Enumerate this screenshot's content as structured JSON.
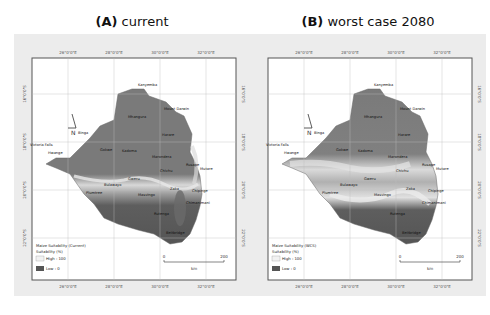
{
  "figure": {
    "panels": [
      {
        "id": "A",
        "letter": "(A)",
        "title": "current",
        "legend": {
          "title": "Maize Suitability (Current)",
          "unit": "Suitability (%)",
          "high": "High : 100",
          "low": "Low : 0"
        }
      },
      {
        "id": "B",
        "letter": "(B)",
        "title": "worst case 2080",
        "legend": {
          "title": "Maize Suitability (WCS)",
          "unit": "Suitability (%)",
          "high": "High : 100",
          "low": "Low : 0"
        }
      }
    ],
    "longitude_ticks": [
      "26°0'0\"E",
      "28°0'0\"E",
      "30°0'0\"E",
      "32°0'0\"E"
    ],
    "latitude_ticks": [
      "16°0'0\"S",
      "18°0'0\"S",
      "20°0'0\"S",
      "22°0'0\"S"
    ],
    "north_arrow": "N",
    "scale_bar": {
      "start": "0",
      "end": "200",
      "unit": "km"
    },
    "places": [
      "Kanyemba",
      "Mhangura",
      "Mount Darwin",
      "Binga",
      "Victoria Falls",
      "Hwange",
      "Gokwe",
      "Kadoma",
      "Harare",
      "Marondera",
      "Chivhu",
      "Mutare",
      "Rusape",
      "Gweru",
      "Bulawayo",
      "Plumtree",
      "Masvingo",
      "Zaka",
      "Chipinge",
      "Chimanimani",
      "Rutenga",
      "Beitbridge"
    ],
    "colors": {
      "background": "#ececec",
      "frame": "#555555",
      "low": "#6e6e6e",
      "high": "#f5f5f5",
      "country": "#7a7a7a"
    }
  }
}
